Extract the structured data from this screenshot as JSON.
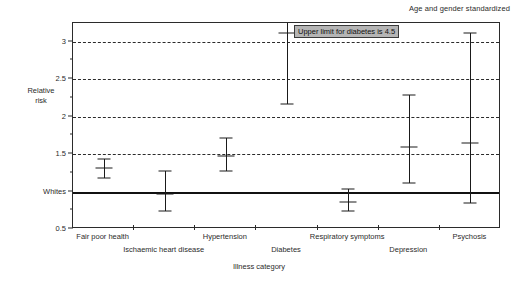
{
  "chart_data": {
    "type": "scatter",
    "title": "",
    "note": "Age and gender standardized",
    "xlabel": "Illness category",
    "ylabel": "Relative\nrisk",
    "ylabel_lines": [
      "Relative",
      "risk"
    ],
    "ylim": [
      0.5,
      3.25
    ],
    "grid": true,
    "gridlines": [
      1.5,
      2.0,
      2.5,
      3.0
    ],
    "legend": "none",
    "baseline": {
      "value": 1.0,
      "label": "Whites"
    },
    "ytick_labels": [
      "3",
      "2.5",
      "2",
      "1.5",
      "Whites",
      "0.5"
    ],
    "ytick_values": [
      3.0,
      2.5,
      2.0,
      1.5,
      1.0,
      0.5
    ],
    "yminor_values": [
      2.75,
      2.25,
      1.75,
      1.25,
      0.75
    ],
    "annotation": "Upper limit for diabetes is 4.5",
    "categories": [
      "Fair poor health",
      "Ischaemic heart disease",
      "Hypertension",
      "Diabetes",
      "Respiratory symptoms",
      "Depression",
      "Psychosis"
    ],
    "series": [
      {
        "name": "Relative risk with 95% CI",
        "points": [
          {
            "category": "Fair poor health",
            "value": 1.31,
            "low": 1.18,
            "high": 1.43,
            "clipped_high": false
          },
          {
            "category": "Ischaemic heart disease",
            "value": 0.97,
            "low": 0.74,
            "high": 1.27,
            "clipped_high": false
          },
          {
            "category": "Hypertension",
            "value": 1.48,
            "low": 1.27,
            "high": 1.72,
            "clipped_high": false
          },
          {
            "category": "Diabetes",
            "value": 3.12,
            "low": 2.17,
            "high": 4.5,
            "clipped_high": true
          },
          {
            "category": "Respiratory symptoms",
            "value": 0.86,
            "low": 0.74,
            "high": 1.03,
            "clipped_high": false
          },
          {
            "category": "Depression",
            "value": 1.6,
            "low": 1.12,
            "high": 2.29,
            "clipped_high": false
          },
          {
            "category": "Psychosis",
            "value": 1.65,
            "low": 0.85,
            "high": 3.12,
            "clipped_high": false
          }
        ]
      }
    ]
  },
  "figure": {
    "note_text": "Age and gender standardized",
    "y_axis_title_line1": "Relative",
    "y_axis_title_line2": "risk",
    "x_axis_title": "Illness category",
    "annotation_text": "Upper limit for diabetes is 4.5"
  },
  "colors": {
    "axis": "#2b2b2b",
    "marker": "#1a1a1a",
    "baseline": "#111111",
    "grid": "#2b2b2b",
    "annotation_bg": "#b5b5b5",
    "background": "#ffffff"
  }
}
